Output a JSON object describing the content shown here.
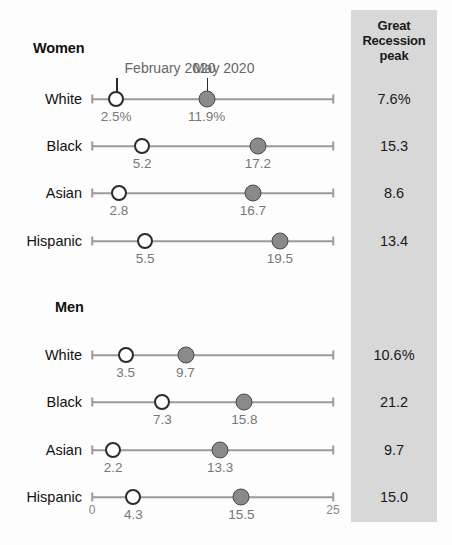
{
  "chart_data": {
    "type": "scatter",
    "title": "",
    "xlabel": "",
    "ylabel": "",
    "xlim": [
      0,
      25
    ],
    "xticks": [
      "0",
      "25"
    ],
    "grid": false,
    "legend_position": "inline-callout",
    "series": [
      {
        "name": "February 2020",
        "marker": "open-circle"
      },
      {
        "name": "May 2020",
        "marker": "filled-circle"
      }
    ],
    "groups": [
      {
        "name": "Women",
        "rows": [
          {
            "category": "White",
            "february_2020": 2.5,
            "may_2020": 11.9,
            "february_label": "2.5%",
            "may_label": "11.9%",
            "great_recession_peak": "7.6%"
          },
          {
            "category": "Black",
            "february_2020": 5.2,
            "may_2020": 17.2,
            "february_label": "5.2",
            "may_label": "17.2",
            "great_recession_peak": "15.3"
          },
          {
            "category": "Asian",
            "february_2020": 2.8,
            "may_2020": 16.7,
            "february_label": "2.8",
            "may_label": "16.7",
            "great_recession_peak": "8.6"
          },
          {
            "category": "Hispanic",
            "february_2020": 5.5,
            "may_2020": 19.5,
            "february_label": "5.5",
            "may_label": "19.5",
            "great_recession_peak": "13.4"
          }
        ]
      },
      {
        "name": "Men",
        "rows": [
          {
            "category": "White",
            "february_2020": 3.5,
            "may_2020": 9.7,
            "february_label": "3.5",
            "may_label": "9.7",
            "great_recession_peak": "10.6%"
          },
          {
            "category": "Black",
            "february_2020": 7.3,
            "may_2020": 15.8,
            "february_label": "7.3",
            "may_label": "15.8",
            "great_recession_peak": "21.2"
          },
          {
            "category": "Asian",
            "february_2020": 2.2,
            "may_2020": 13.3,
            "february_label": "2.2",
            "may_label": "13.3",
            "great_recession_peak": "9.7"
          },
          {
            "category": "Hispanic",
            "february_2020": 4.3,
            "may_2020": 15.5,
            "february_label": "4.3",
            "may_label": "15.5",
            "great_recession_peak": "15.0"
          }
        ]
      }
    ]
  },
  "panel": {
    "header_line1": "Great",
    "header_line2": "Recession",
    "header_line3": "peak"
  },
  "callouts": {
    "february": "February 2020",
    "may": "May 2020"
  },
  "axis": {
    "min_label": "0",
    "max_label": "25"
  },
  "colors": {
    "panel_bg": "#d8d8d8",
    "axis": "#9a9a9a",
    "dot_open_stroke": "#2b2b2b",
    "dot_filled_fill": "#8a8a8a",
    "value_text": "#777777",
    "label_text": "#111111"
  }
}
